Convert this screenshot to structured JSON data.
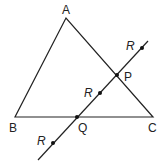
{
  "diagram": {
    "type": "geometry",
    "points": {
      "A": {
        "label": "A",
        "x": 66,
        "y": 18
      },
      "B": {
        "label": "B",
        "x": 15,
        "y": 117
      },
      "C": {
        "label": "C",
        "x": 153,
        "y": 117
      },
      "P": {
        "label": "P",
        "x": 117,
        "y": 75
      },
      "Q": {
        "label": "Q",
        "x": 77,
        "y": 117
      }
    },
    "line": {
      "x1": 38,
      "y1": 160,
      "x2": 148,
      "y2": 41
    },
    "r_points": [
      {
        "label": "R",
        "x": 142,
        "y": 48
      },
      {
        "label": "R",
        "x": 100,
        "y": 93
      },
      {
        "label": "R",
        "x": 53,
        "y": 143
      }
    ],
    "stroke_color": "#222222"
  }
}
